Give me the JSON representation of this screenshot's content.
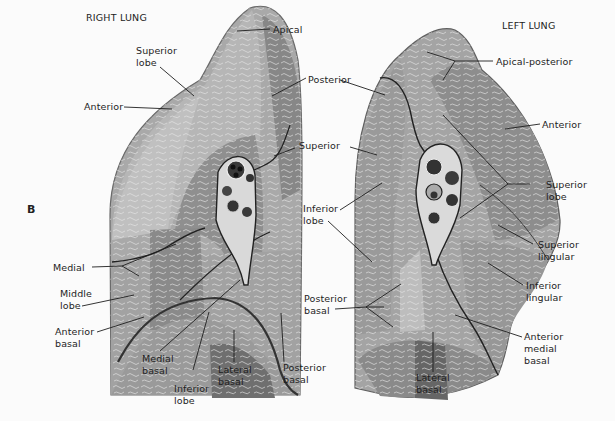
{
  "figure": {
    "panel_letter": "B",
    "colors": {
      "background": "#fbfbfb",
      "lung_light": "#b9b9b9",
      "lung_mid": "#9c9c9c",
      "lung_dark": "#7a7a7a",
      "outline": "#555555",
      "leader_line": "#1e1e1e",
      "text": "#1e1e1e"
    },
    "right_lung": {
      "title": "RIGHT LUNG",
      "labels": {
        "apical": "Apical",
        "superior_lobe_1": "Superior",
        "superior_lobe_2": "lobe",
        "anterior": "Anterior",
        "posterior": "Posterior",
        "superior": "Superior",
        "medial": "Medial",
        "middle_lobe_1": "Middle",
        "middle_lobe_2": "lobe",
        "anterior_basal_1": "Anterior",
        "anterior_basal_2": "basal",
        "medial_basal_1": "Medial",
        "medial_basal_2": "basal",
        "inferior_lobe_1": "Inferior",
        "inferior_lobe_2": "lobe",
        "lateral_basal_1": "Lateral",
        "lateral_basal_2": "basal",
        "posterior_basal_1": "Posterior",
        "posterior_basal_2": "basal"
      }
    },
    "left_lung": {
      "title": "LEFT LUNG",
      "labels": {
        "apical_posterior": "Apical-posterior",
        "anterior": "Anterior",
        "superior_lobe_1": "Superior",
        "superior_lobe_2": "lobe",
        "superior_lingular_1": "Superior",
        "superior_lingular_2": "lingular",
        "inferior_lingular_1": "Inferior",
        "inferior_lingular_2": "lingular",
        "anterior_medial_basal_1": "Anterior",
        "anterior_medial_basal_2": "medial",
        "anterior_medial_basal_3": "basal",
        "lateral_basal_1": "Lateral",
        "lateral_basal_2": "basal",
        "inferior_lobe_1": "Inferior",
        "inferior_lobe_2": "lobe",
        "posterior_basal_1": "Posterior",
        "posterior_basal_2": "basal"
      }
    }
  }
}
